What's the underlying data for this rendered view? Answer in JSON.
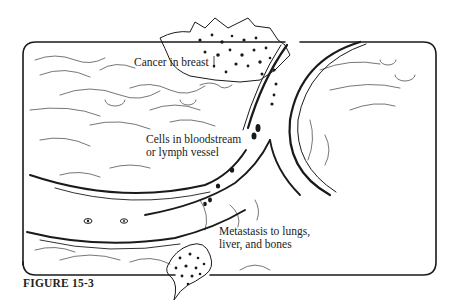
{
  "figure": {
    "caption": "FIGURE 15-3",
    "labels": {
      "primary_tumor": "Cancer in breast",
      "circulation": [
        "Cells in bloodstream",
        "or lymph vessel"
      ],
      "metastasis": [
        "Metastasis to lungs,",
        "liver, and bones"
      ]
    },
    "style": {
      "ink": "#1a1a1a",
      "paper": "#ffffff"
    }
  }
}
